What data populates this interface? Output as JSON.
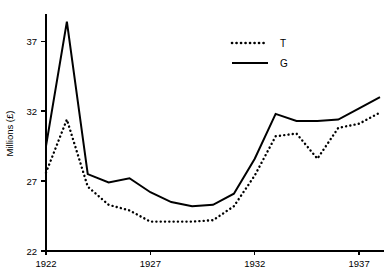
{
  "chart_data": {
    "type": "line",
    "title": "",
    "xlabel": "",
    "ylabel": "Millions (£)",
    "x": [
      1922,
      1923,
      1924,
      1925,
      1926,
      1927,
      1928,
      1929,
      1930,
      1931,
      1932,
      1933,
      1934,
      1935,
      1936,
      1937,
      1938
    ],
    "xlim": [
      1922,
      1938
    ],
    "ylim": [
      22,
      38.8
    ],
    "xticks": [
      1922,
      1927,
      1932,
      1937
    ],
    "xticklabels": [
      "1922",
      "1927",
      "1932",
      "1937"
    ],
    "yticks": [
      22,
      27,
      32,
      37
    ],
    "yticklabels": [
      "22",
      "27",
      "32",
      "37"
    ],
    "grid": false,
    "legend_position": "top-right",
    "series": [
      {
        "name": "T",
        "style": "dotted",
        "color": "#000000",
        "values": [
          27.6,
          31.4,
          26.6,
          25.3,
          24.9,
          24.1,
          24.1,
          24.1,
          24.2,
          25.2,
          27.4,
          30.2,
          30.4,
          28.6,
          30.8,
          31.1,
          31.9
        ]
      },
      {
        "name": "G",
        "style": "solid",
        "color": "#000000",
        "values": [
          29.5,
          38.4,
          27.5,
          26.9,
          27.2,
          26.2,
          25.5,
          25.2,
          25.3,
          26.1,
          28.6,
          31.8,
          31.3,
          31.3,
          31.4,
          32.2,
          33.0
        ]
      }
    ]
  },
  "legend": {
    "entries": [
      {
        "label": "T"
      },
      {
        "label": "G"
      }
    ]
  },
  "axis": {
    "y_title": "Millions (£)"
  }
}
